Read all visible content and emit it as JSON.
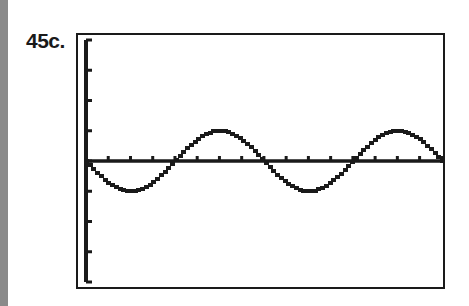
{
  "figure": {
    "label": "45c."
  },
  "chart_data": {
    "type": "line",
    "title": "",
    "xlabel": "",
    "ylabel": "",
    "series": [
      {
        "name": "y = -sin(x)",
        "x": [
          0,
          0.785,
          1.571,
          2.356,
          3.142,
          3.927,
          4.712,
          5.498,
          6.283,
          7.069,
          7.854,
          8.639,
          9.425,
          10.21,
          10.996,
          11.781,
          12.566
        ],
        "values": [
          0,
          -0.707,
          -1,
          -0.707,
          0,
          0.707,
          1,
          0.707,
          0,
          -0.707,
          -1,
          -0.707,
          0,
          0.707,
          1,
          0.707,
          0
        ]
      }
    ],
    "xlim": [
      0,
      12.566
    ],
    "ylim": [
      -4,
      4
    ],
    "x_tick_spacing": 0.785,
    "y_tick_spacing": 1,
    "grid": false,
    "axes": "calculator-style with tick marks"
  },
  "colors": {
    "ink": "#1a1a1a",
    "side_bar": "#8a8a8a",
    "background": "#ffffff"
  }
}
